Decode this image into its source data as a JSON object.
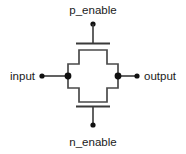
{
  "diagram": {
    "background_color": "#ffffff",
    "line_color": "#3a3a3a",
    "dot_color": "#111111",
    "labels": {
      "top": "p_enable",
      "bottom": "n_enable",
      "left": "input",
      "right": "output"
    },
    "terminals": [
      {
        "name": "p_enable",
        "x": 93,
        "y": 24
      },
      {
        "name": "n_enable",
        "x": 93,
        "y": 125
      },
      {
        "name": "input",
        "x": 42,
        "y": 76
      },
      {
        "name": "output",
        "x": 137,
        "y": 76
      }
    ],
    "nodes": [
      {
        "name": "input-junction",
        "x": 68,
        "y": 76
      },
      {
        "name": "output-junction",
        "x": 118,
        "y": 76
      }
    ],
    "gates": {
      "pmos_bar_y": 43,
      "nmos_bar_y": 106,
      "bar_x1": 76,
      "bar_x2": 110
    },
    "body": {
      "shape": "cross",
      "points": "79,50 107,50 107,64 118,64 118,88 107,88 107,102 79,102 79,88 68,88 68,64 79,64"
    }
  }
}
